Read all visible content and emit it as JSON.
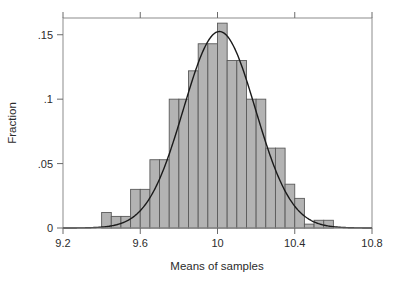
{
  "chart_data": {
    "type": "bar",
    "title": "",
    "subtitle": "",
    "xlabel": "Means of samples",
    "ylabel": "Fraction",
    "xlim": [
      9.2,
      10.8
    ],
    "ylim": [
      0,
      0.163
    ],
    "grid": false,
    "legend": null,
    "bin_width": 0.05,
    "xticks": [
      9.2,
      9.6,
      10,
      10.4,
      10.8
    ],
    "xtick_labels": [
      "9.2",
      "9.6",
      "10",
      "10.4",
      "10.8"
    ],
    "yticks": [
      0,
      0.05,
      0.1,
      0.15
    ],
    "ytick_labels": [
      "0",
      ".05",
      ".1",
      ".15"
    ],
    "bar_fill": "#b3b3b3",
    "bar_stroke": "#5a5a5a",
    "curve_color": "#1a1a1a",
    "axis_color": "#6b6b6b",
    "bin_centers": [
      9.225,
      9.275,
      9.325,
      9.375,
      9.425,
      9.475,
      9.525,
      9.575,
      9.625,
      9.675,
      9.725,
      9.775,
      9.825,
      9.875,
      9.925,
      9.975,
      10.025,
      10.075,
      10.125,
      10.175,
      10.225,
      10.275,
      10.325,
      10.375,
      10.425,
      10.475,
      10.525,
      10.575,
      10.625,
      10.675,
      10.725,
      10.775
    ],
    "values": [
      0.0,
      0.0,
      0.0,
      0.0,
      0.012,
      0.009,
      0.009,
      0.03,
      0.03,
      0.053,
      0.053,
      0.1,
      0.1,
      0.122,
      0.143,
      0.143,
      0.159,
      0.13,
      0.13,
      0.1,
      0.1,
      0.062,
      0.062,
      0.034,
      0.023,
      0.003,
      0.006,
      0.006,
      0.0,
      0.0,
      0.0,
      0.0
    ],
    "curve": {
      "label": "normal density overlay",
      "mean": 10.01,
      "peak_value": 0.1525,
      "sd": 0.186
    }
  },
  "axes": {
    "y_axis_title": "Fraction",
    "x_axis_title": "Means of samples"
  }
}
